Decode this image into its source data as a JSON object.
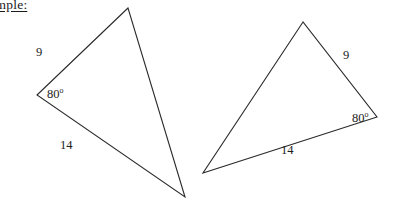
{
  "page": {
    "width": 393,
    "height": 203,
    "background_color": "#ffffff",
    "stroke_color": "#2a2a2a",
    "text_color": "#1c1c1c"
  },
  "caption": {
    "text": "Example:",
    "underlined": true,
    "clipped_at_left_edge": true,
    "visible_fragment": "le:"
  },
  "figure": {
    "triangles": [
      {
        "name": "left-triangle",
        "vertices": [
          {
            "name": "apex",
            "x": 128,
            "y": 8
          },
          {
            "name": "angle-vertex",
            "x": 37,
            "y": 95
          },
          {
            "name": "bottom",
            "x": 185,
            "y": 197
          }
        ],
        "labels": [
          {
            "name": "side-9",
            "text": "9",
            "x": 36,
            "y": 46
          },
          {
            "name": "angle-80",
            "text": "80",
            "degree_symbol": "o",
            "x": 47,
            "y": 88
          },
          {
            "name": "side-14",
            "text": "14",
            "x": 60,
            "y": 139
          }
        ],
        "angle_mark": {
          "vertex": {
            "x": 37,
            "y": 95
          },
          "arm_a": {
            "x": 128,
            "y": 8
          },
          "arm_b": {
            "x": 185,
            "y": 197
          }
        }
      },
      {
        "name": "right-triangle",
        "vertices": [
          {
            "name": "apex",
            "x": 303,
            "y": 22
          },
          {
            "name": "left",
            "x": 203,
            "y": 173
          },
          {
            "name": "angle-vertex",
            "x": 377,
            "y": 117
          }
        ],
        "labels": [
          {
            "name": "side-9",
            "text": "9",
            "x": 343,
            "y": 49
          },
          {
            "name": "angle-80",
            "text": "80",
            "degree_symbol": "o",
            "x": 352,
            "y": 112
          },
          {
            "name": "side-14",
            "text": "14",
            "x": 281,
            "y": 144
          }
        ],
        "angle_mark": {
          "vertex": {
            "x": 377,
            "y": 117
          },
          "arm_a": {
            "x": 303,
            "y": 22
          },
          "arm_b": {
            "x": 203,
            "y": 173
          }
        }
      }
    ],
    "values": {
      "side_short": "9",
      "side_long": "14",
      "angle": "80",
      "degree_symbol": "o"
    }
  }
}
